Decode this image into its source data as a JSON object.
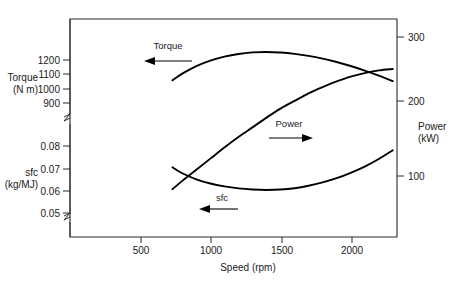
{
  "chart_data": {
    "type": "line",
    "title": "",
    "xlabel": "Speed (rpm)",
    "xticks": [
      500,
      1000,
      1500,
      2000
    ],
    "xlim": [
      0,
      2330
    ],
    "grid": false,
    "legend_position": "inline-annotations",
    "axes": [
      {
        "id": "torque",
        "side": "left",
        "label_line1": "Torque",
        "label_line2": "(N m)",
        "unit": "N m",
        "ticks": [
          1200,
          1100,
          1000,
          900
        ],
        "tick_labels": [
          "1200",
          "1100",
          "1000",
          "900"
        ],
        "broken": true
      },
      {
        "id": "sfc",
        "side": "left",
        "label_line1": "sfc",
        "label_line2": "(kg/MJ)",
        "unit": "kg/MJ",
        "ticks": [
          0.08,
          0.07,
          0.06,
          0.05
        ],
        "tick_labels": [
          "0.08",
          "0.07",
          "0.06",
          "0.05"
        ],
        "broken": true
      },
      {
        "id": "power",
        "side": "right",
        "label_line1": "Power",
        "label_line2": "(kW)",
        "unit": "kW",
        "ticks": [
          300,
          200,
          100
        ],
        "tick_labels": [
          "300",
          "200",
          "100"
        ],
        "broken": false
      }
    ],
    "series": [
      {
        "name": "Torque",
        "axis": "torque",
        "unit": "N m",
        "arrow_direction": "left",
        "x": [
          730,
          800,
          900,
          1000,
          1100,
          1200,
          1300,
          1400,
          1500,
          1600,
          1700,
          1800,
          1900,
          2000,
          2100,
          2200,
          2300
        ],
        "values": [
          1058,
          1105,
          1158,
          1196,
          1223,
          1242,
          1253,
          1256,
          1252,
          1243,
          1229,
          1210,
          1186,
          1158,
          1126,
          1091,
          1053
        ]
      },
      {
        "name": "Power",
        "axis": "power",
        "unit": "kW",
        "arrow_direction": "right",
        "x": [
          730,
          800,
          900,
          1000,
          1100,
          1200,
          1300,
          1400,
          1500,
          1600,
          1700,
          1800,
          1900,
          2000,
          2100,
          2200,
          2300
        ],
        "values": [
          81,
          93,
          109,
          125,
          141,
          156,
          170,
          184,
          197,
          208,
          219,
          228,
          236,
          243,
          248,
          252,
          254
        ]
      },
      {
        "name": "sfc",
        "axis": "sfc",
        "unit": "kg/MJ",
        "arrow_direction": "left",
        "x": [
          730,
          800,
          900,
          1000,
          1100,
          1200,
          1300,
          1400,
          1500,
          1600,
          1700,
          1800,
          1900,
          2000,
          2100,
          2200,
          2300
        ],
        "values": [
          0.0705,
          0.0678,
          0.0651,
          0.0632,
          0.0619,
          0.061,
          0.0605,
          0.0603,
          0.0605,
          0.0611,
          0.0622,
          0.0637,
          0.0656,
          0.068,
          0.0708,
          0.0742,
          0.0781
        ]
      }
    ],
    "annotations": [
      {
        "name": "torque-annotation",
        "text": "Torque",
        "arrow": "left"
      },
      {
        "name": "power-annotation",
        "text": "Power",
        "arrow": "right"
      },
      {
        "name": "sfc-annotation",
        "text": "sfc",
        "arrow": "left"
      }
    ],
    "colors": {
      "curve": "#000000",
      "axis": "#2a2a2a",
      "background": "#ffffff"
    }
  },
  "axis_ticks": {
    "torque": [
      "1200",
      "1100",
      "1000",
      "900"
    ],
    "sfc": [
      "0.08",
      "0.07",
      "0.06",
      "0.05"
    ],
    "power": [
      "300",
      "200",
      "100"
    ],
    "speed": [
      "500",
      "1000",
      "1500",
      "2000"
    ]
  },
  "labels": {
    "torque_line1": "Torque",
    "torque_line2": "(N m)",
    "sfc_line1": "sfc",
    "sfc_line2": "(kg/MJ)",
    "power_line1": "Power",
    "power_line2": "(kW)",
    "xaxis": "Speed (rpm)",
    "ann_torque": "Torque",
    "ann_power": "Power",
    "ann_sfc": "sfc"
  }
}
